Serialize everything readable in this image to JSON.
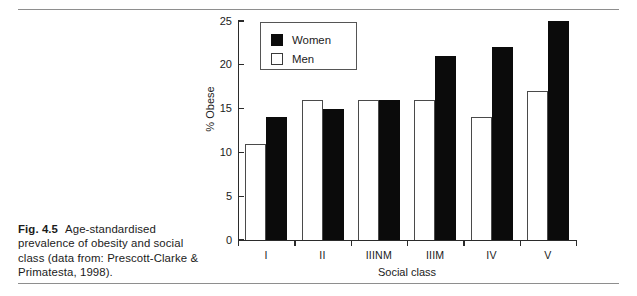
{
  "caption": {
    "figure_number": "Fig. 4.5",
    "text": "Age-standardised prevalence of obesity and social class (data from: Prescott-Clarke & Primatesta, 1998)."
  },
  "legend": {
    "items": [
      {
        "label": "Women",
        "style": "filled",
        "color": "#0b0b0b"
      },
      {
        "label": "Men",
        "style": "hollow",
        "color": "#ffffff"
      }
    ]
  },
  "chart_data": {
    "type": "bar",
    "title": "",
    "xlabel": "Social class",
    "ylabel": "% Obese",
    "categories": [
      "I",
      "II",
      "IIINM",
      "IIIM",
      "IV",
      "V"
    ],
    "series": [
      {
        "name": "Men",
        "values": [
          11,
          16,
          16,
          16,
          14,
          17
        ]
      },
      {
        "name": "Women",
        "values": [
          14,
          15,
          16,
          21,
          22,
          25
        ]
      }
    ],
    "ylim": [
      0,
      25
    ],
    "yticks": [
      0,
      5,
      10,
      15,
      20,
      25
    ],
    "ytick_labels": [
      "0",
      "5",
      "10",
      "15",
      "20",
      "25"
    ],
    "grid": false,
    "legend_position": "upper left inside"
  }
}
